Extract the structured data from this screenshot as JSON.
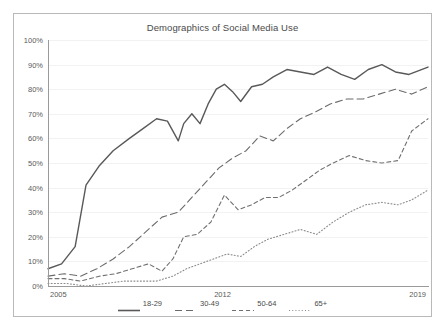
{
  "chart_data": {
    "type": "line",
    "title": "Demographics of Social Media Use",
    "xlabel": "",
    "ylabel": "",
    "ylim": [
      0,
      100
    ],
    "xlim": [
      2005,
      2019
    ],
    "grid": true,
    "legend_position": "bottom",
    "y_ticks": [
      "0%",
      "10%",
      "20%",
      "30%",
      "40%",
      "50%",
      "60%",
      "70%",
      "80%",
      "90%",
      "100%"
    ],
    "y_tick_values": [
      0,
      10,
      20,
      30,
      40,
      50,
      60,
      70,
      80,
      90,
      100
    ],
    "x_ticks": [
      "2005",
      "2012",
      "2019"
    ],
    "x_tick_values": [
      2005,
      2012,
      2019
    ],
    "series": [
      {
        "name": "18-29",
        "style": "solid",
        "color": "#595959",
        "x": [
          2005.0,
          2005.5,
          2006.0,
          2006.4,
          2006.9,
          2007.4,
          2008.0,
          2008.5,
          2009.0,
          2009.4,
          2009.8,
          2010.0,
          2010.3,
          2010.6,
          2010.9,
          2011.2,
          2011.5,
          2011.8,
          2012.1,
          2012.5,
          2012.9,
          2013.3,
          2013.8,
          2014.3,
          2014.8,
          2015.3,
          2015.8,
          2016.3,
          2016.8,
          2017.3,
          2017.8,
          2018.3,
          2019.0
        ],
        "values": [
          7,
          9,
          16,
          41,
          49,
          55,
          60,
          64,
          68,
          67,
          59,
          66,
          70,
          66,
          74,
          80,
          82,
          79,
          75,
          81,
          82,
          85,
          88,
          87,
          86,
          89,
          86,
          84,
          88,
          90,
          87,
          86,
          89
        ]
      },
      {
        "name": "30-49",
        "style": "dashed-long",
        "color": "#6b6b6b",
        "x": [
          2005.0,
          2005.6,
          2006.2,
          2006.8,
          2007.4,
          2008.0,
          2008.6,
          2009.2,
          2009.8,
          2010.3,
          2010.8,
          2011.3,
          2011.8,
          2012.3,
          2012.8,
          2013.3,
          2013.8,
          2014.3,
          2014.9,
          2015.4,
          2016.0,
          2016.6,
          2017.2,
          2017.8,
          2018.4,
          2019.0
        ],
        "values": [
          4,
          5,
          4,
          7,
          11,
          16,
          22,
          28,
          30,
          36,
          42,
          48,
          52,
          55,
          61,
          59,
          64,
          68,
          71,
          74,
          76,
          76,
          78,
          80,
          78,
          81
        ]
      },
      {
        "name": "50-64",
        "style": "dashed-short",
        "color": "#707070",
        "x": [
          2005.0,
          2005.6,
          2006.2,
          2006.9,
          2007.5,
          2008.1,
          2008.7,
          2009.2,
          2009.6,
          2010.0,
          2010.5,
          2011.0,
          2011.5,
          2012.0,
          2012.5,
          2013.0,
          2013.5,
          2014.0,
          2014.5,
          2015.0,
          2015.5,
          2016.1,
          2016.7,
          2017.3,
          2017.9,
          2018.4,
          2019.0
        ],
        "values": [
          3,
          3,
          2,
          4,
          5,
          7,
          9,
          6,
          11,
          20,
          21,
          26,
          37,
          31,
          33,
          36,
          36,
          39,
          43,
          47,
          50,
          53,
          51,
          50,
          51,
          63,
          68
        ]
      },
      {
        "name": "65+",
        "style": "dotted",
        "color": "#8a8a8a",
        "x": [
          2005.0,
          2005.7,
          2006.4,
          2007.1,
          2007.8,
          2008.4,
          2009.0,
          2009.6,
          2010.1,
          2010.6,
          2011.1,
          2011.6,
          2012.1,
          2012.6,
          2013.1,
          2013.7,
          2014.3,
          2014.9,
          2015.5,
          2016.1,
          2016.7,
          2017.3,
          2017.9,
          2018.4,
          2019.0
        ],
        "values": [
          1,
          1,
          0,
          1,
          2,
          2,
          2,
          4,
          7,
          9,
          11,
          13,
          12,
          16,
          19,
          21,
          23,
          21,
          26,
          30,
          33,
          34,
          33,
          35,
          39
        ]
      }
    ]
  },
  "legend": {
    "items": [
      {
        "label": "18-29"
      },
      {
        "label": "30-49"
      },
      {
        "label": "50-64"
      },
      {
        "label": "65+"
      }
    ]
  }
}
